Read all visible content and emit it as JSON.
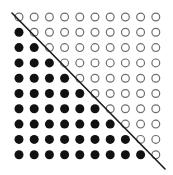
{
  "diagram": {
    "type": "dot-grid-triangular",
    "rows": 10,
    "cols": 10,
    "filled_count": 45,
    "open_count": 55,
    "rule": "row index > column index is filled; otherwise open",
    "colors": {
      "background": "#ffffff",
      "filled": "#111111",
      "open_stroke": "#6e6e6e",
      "line": "#1a1a1a"
    },
    "grid": {
      "x0": 19,
      "y0": 17,
      "dx": 15.2,
      "dy": 15.3,
      "radius": 4.5
    },
    "diagonal_line": {
      "x1": 12,
      "y1": 13,
      "x2": 165,
      "y2": 169
    }
  }
}
